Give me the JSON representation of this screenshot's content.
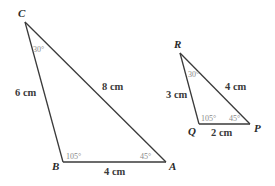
{
  "figure": {
    "triangle_abc": {
      "vertices": {
        "C": {
          "label": "C",
          "x": 25,
          "y": 22
        },
        "B": {
          "label": "B",
          "x": 63,
          "y": 162
        },
        "A": {
          "label": "A",
          "x": 166,
          "y": 162
        }
      },
      "sides": {
        "CB": "6 cm",
        "CA": "8 cm",
        "BA": "4 cm"
      },
      "angles": {
        "C": "30°",
        "B": "105°",
        "A": "45°"
      }
    },
    "triangle_pqr": {
      "vertices": {
        "R": {
          "label": "R",
          "x": 180,
          "y": 53
        },
        "Q": {
          "label": "Q",
          "x": 199,
          "y": 124
        },
        "P": {
          "label": "P",
          "x": 250,
          "y": 124
        }
      },
      "sides": {
        "RQ": "3 cm",
        "RP": "4 cm",
        "QP": "2 cm"
      },
      "angles": {
        "R": "30°",
        "Q": "105°",
        "P": "45°"
      }
    },
    "colors": {
      "edge": "#3a3a3a",
      "angle_text": "#8a8a8a"
    }
  }
}
